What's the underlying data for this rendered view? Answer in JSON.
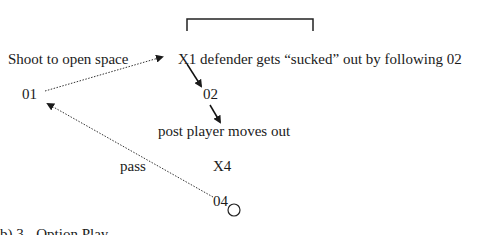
{
  "diagram": {
    "labels": {
      "shoot": "Shoot to open space",
      "x1_note": "X1 defender gets “sucked” out by following 02",
      "o1": "01",
      "o2": "02",
      "post_note": "post player moves out",
      "x4": "X4",
      "pass": "pass",
      "o4": "04"
    },
    "caption": "b) 3 - Option Play",
    "elements": {
      "goal": "basket-bracket",
      "ball": "circle-icon"
    },
    "colors": {
      "ink": "#1a1a1a",
      "background": "#ffffff"
    }
  }
}
